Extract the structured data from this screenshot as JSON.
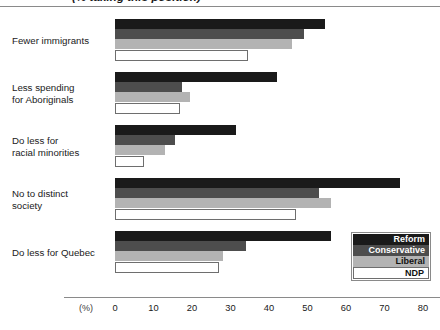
{
  "title": "(% taking this position)",
  "axis": {
    "unit_label": "(%)",
    "ticks": [
      0,
      10,
      20,
      30,
      40,
      50,
      60,
      70,
      80
    ]
  },
  "legend": {
    "items": [
      {
        "label": "Reform",
        "color": "#1a1a1a"
      },
      {
        "label": "Conservative",
        "color": "#4d4d4d"
      },
      {
        "label": "Liberal",
        "color": "#b3b3b3"
      },
      {
        "label": "NDP",
        "color": "#ffffff"
      }
    ]
  },
  "categories": [
    {
      "line1": "Fewer immigrants",
      "line2": ""
    },
    {
      "line1": "Less spending",
      "line2": "for Aboriginals"
    },
    {
      "line1": "Do less for",
      "line2": "racial minorities"
    },
    {
      "line1": "No to distinct",
      "line2": "society"
    },
    {
      "line1": "Do less for Quebec",
      "line2": ""
    }
  ],
  "chart_data": {
    "type": "bar",
    "orientation": "horizontal",
    "title": "(% taking this position)",
    "xlabel": "(%)",
    "ylabel": "",
    "xlim": [
      0,
      80
    ],
    "grid": false,
    "legend_position": "bottom-right",
    "categories": [
      "Fewer immigrants",
      "Less spending for Aboriginals",
      "Do less for racial minorities",
      "No to distinct society",
      "Do less for Quebec"
    ],
    "series": [
      {
        "name": "Reform",
        "color": "#1a1a1a",
        "values": [
          54.5,
          42.0,
          31.5,
          74.0,
          56.0
        ]
      },
      {
        "name": "Conservative",
        "color": "#4d4d4d",
        "values": [
          49.0,
          17.5,
          15.5,
          53.0,
          34.0
        ]
      },
      {
        "name": "Liberal",
        "color": "#b3b3b3",
        "values": [
          46.0,
          19.5,
          13.0,
          56.0,
          28.0
        ]
      },
      {
        "name": "NDP",
        "color": "#ffffff",
        "values": [
          34.5,
          17.0,
          7.5,
          47.0,
          27.0
        ]
      }
    ]
  }
}
